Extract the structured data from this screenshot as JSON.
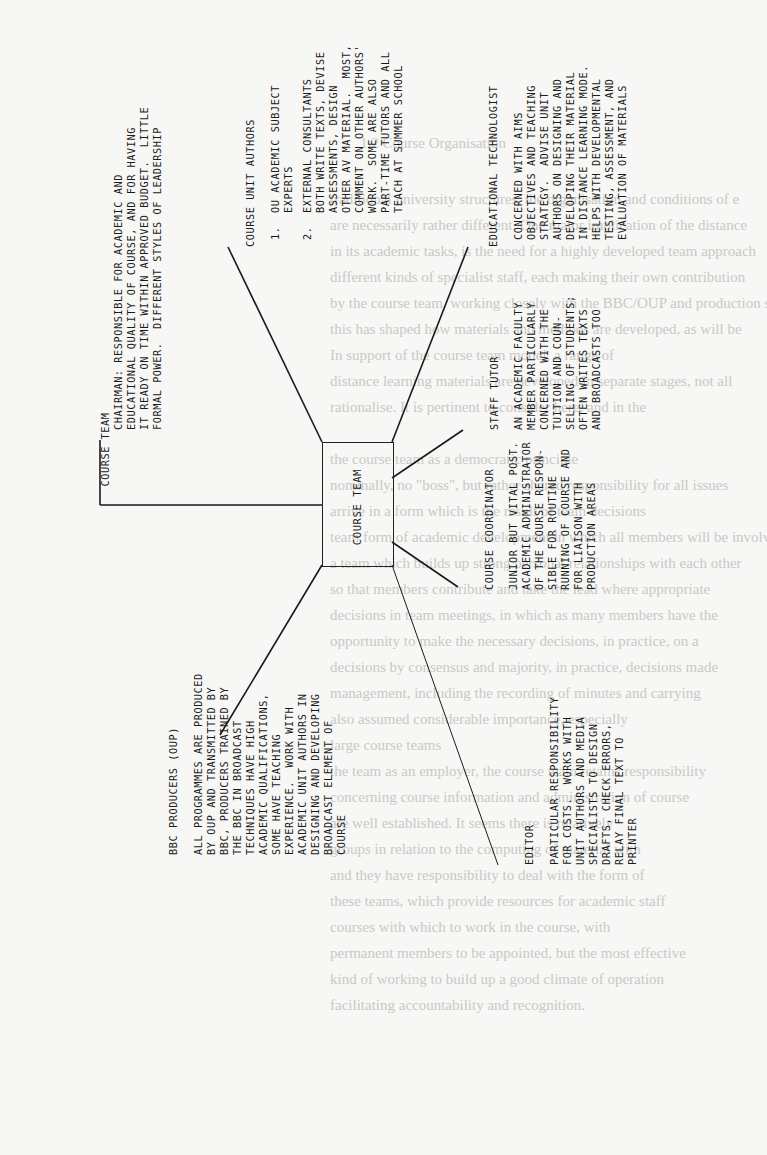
{
  "background_page": {
    "section_heading": "1.2   Course Organisation",
    "lines": [
      "traditional university structures, the organisation and conditions of e",
      "are necessarily rather different. One major implication of the distance",
      "in its academic tasks, is the need for a highly developed team approach",
      "different kinds of specialist staff, each making their own contribution",
      "by the course team, working closely with the BBC/OUP and production st",
      "this has shaped how materials and methods are developed, as will be",
      "In support of the course team model, a range of",
      "distance learning materials are developed in separate stages, not all",
      "rationalise. It is pertinent to consider here, and in the",
      "",
      "   the course team as a democratic principle",
      "   nominally, no \"boss\", but rather shared responsibility for all issues",
      "   arrive in a form which is the result of team decisions",
      "   team form of academic development in which all members will be involved",
      "   a team which builds up strong personal relationships with each other",
      "   so that members contribute and take the lead where appropriate",
      "   decisions in team meetings, in which as many members have the",
      "   opportunity to make the necessary decisions, in practice, on a",
      "   decisions by consensus and majority, in practice, decisions made",
      "   management, including the recording of minutes and carrying",
      "   also assumed considerable importance, especially",
      "   large course teams",
      "   the team as an employer, the course team retains responsibility",
      "   concerning course information and administration of course",
      "   are well established. It seems there is relatively",
      "   groups in relation to the computing of material with",
      "   and they have responsibility to deal with the form of",
      "   these teams, which provide resources for academic staff",
      "   courses with which to work in the course, with",
      "   permanent members to be appointed, but the most effective",
      "   kind of working to build up a good climate of operation",
      "   facilitating accountability and recognition."
    ]
  },
  "diagram": {
    "center": {
      "label": "COURSE TEAM"
    },
    "nodes": [
      {
        "id": "chairman",
        "title": "COURSE TEAM",
        "lines": [
          "CHAIRMAN: RESPONSIBLE FOR ACADEMIC AND",
          "EDUCATIONAL QUALITY OF COURSE, AND FOR HAVING",
          "IT READY ON TIME WITHIN APPROVED BUDGET.  LITTLE",
          "FORMAL POWER.  DIFFERENT STYLES OF LEADERSHIP"
        ]
      },
      {
        "id": "course-unit-authors",
        "title": "COURSE UNIT AUTHORS",
        "items": [
          {
            "num": "1.",
            "text": "OU ACADEMIC SUBJECT\nEXPERTS"
          },
          {
            "num": "2.",
            "text": "EXTERNAL CONSULTANTS\nBOTH WRITE TEXTS, DEVISE\nASSESSMENTS, DESIGN\nOTHER AV MATERIAL.  MOST,\nCOMMENT ON OTHER AUTHORS'\nWORK.  SOME ARE ALSO\nPART-TIME TUTORS AND ALL\nTEACH AT SUMMER SCHOOL"
          }
        ]
      },
      {
        "id": "educational-technologist",
        "title": "EDUCATIONAL TECHNOLOGIST",
        "body": "CONCERNED WITH AIMS\nOBJECTIVES AND TEACHING\nSTRATEGY.  ADVISE UNIT\nAUTHORS ON DESIGNING AND\nDEVELOPING THEIR MATERIAL\nIN DISTANCE LEARNING MODE.\nHELPS WITH DEVELOPMENTAL\nTESTING, ASSESSMENT, AND\nEVALUATION OF MATERIALS"
      },
      {
        "id": "staff-tutor",
        "title": "STAFF TUTOR",
        "body": "AN ACADEMIC FACULTY\nMEMBER PARTICULARLY\nCONCERNED WITH THE\nTUITION AND COUN-\nSELLING OF STUDENTS;\nOFTEN WRITES TEXTS\nAND BROADCASTS TOO"
      },
      {
        "id": "course-coordinator",
        "title": "COURSE COORDINATOR",
        "body": "JUNIOR BUT VITAL POST.\nACADEMIC ADMINISTRATOR\nOF THE COURSE RESPON-\nSIBLE FOR ROUTINE\nRUNNING OF COURSE AND\nFOR LIAISON WITH\nPRODUCTION AREAS"
      },
      {
        "id": "editor",
        "title": "EDITOR",
        "body": "PARTICULAR RESPONSIBILITY\nFOR COSTS.  WORKS WITH\nUNIT AUTHORS AND MEDIA\nSPECIALISTS TO DESIGN\nDRAFTS, CHECK ERRORS,\nRELAY FINAL TEXT TO\nPRINTER"
      },
      {
        "id": "bbc-producers",
        "title": "BBC PRODUCERS (OUP)",
        "body": "ALL PROGRAMMES ARE PRODUCED\nBY OUP AND TRANSMITTED BY\nBBC, PRODUCERS TRAINED BY\nTHE BBC IN BROADCAST\nTECHNIQUES HAVE HIGH\nACADEMIC QUALIFICATIONS,\nSOME HAVE TEACHING\nEXPERIENCE.  WORK WITH\nACADEMIC UNIT AUTHORS IN\nDESIGNING AND DEVELOPING\nBROADCAST ELEMENT OF\nCOURSE"
      }
    ]
  },
  "colors": {
    "ink": "#1a1a1a",
    "paper": "#f7f7f5",
    "ghost_text": "#c9c9c6"
  }
}
